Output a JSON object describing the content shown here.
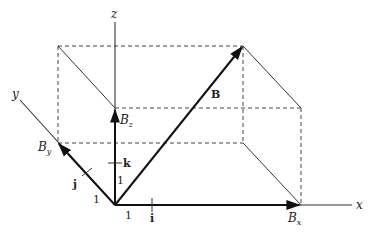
{
  "diagram": {
    "title": "",
    "axes": {
      "x_label": "x",
      "y_label": "y",
      "z_label": "z"
    },
    "vectors": {
      "B": {
        "label": "B"
      },
      "Bx": {
        "label": "B",
        "subscript": "x"
      },
      "By": {
        "label": "B",
        "subscript": "y"
      },
      "Bz": {
        "label": "B",
        "subscript": "z"
      }
    },
    "unit_vectors": {
      "i": "i",
      "j": "j",
      "k": "k"
    },
    "unit_lengths": {
      "x_unit": "1",
      "y_unit": "1",
      "z_unit": "1"
    },
    "colors": {
      "line": "#333333",
      "background": "#ffffff"
    }
  }
}
